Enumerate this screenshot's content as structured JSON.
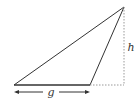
{
  "diagram": {
    "type": "triangle-base-height",
    "labels": {
      "base": "g",
      "height": "h"
    },
    "vertices": {
      "base_left": [
        14,
        85
      ],
      "base_right": [
        90,
        85
      ],
      "apex": [
        124,
        7
      ]
    },
    "colors": {
      "stroke": "#333333",
      "dotted": "#999999",
      "background": "#ffffff"
    }
  }
}
